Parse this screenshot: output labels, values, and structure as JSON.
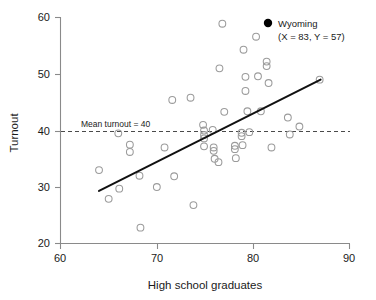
{
  "chart_data": {
    "type": "scatter",
    "title": "",
    "xlabel": "High school graduates",
    "ylabel": "Turnout",
    "xlim": [
      60,
      90
    ],
    "ylim": [
      20,
      60
    ],
    "xticks": [
      60,
      70,
      80,
      90
    ],
    "yticks": [
      20,
      30,
      40,
      50,
      60
    ],
    "xtick_labels": [
      "60",
      "70",
      "80",
      "90"
    ],
    "ytick_labels": [
      "20",
      "30",
      "40",
      "50",
      "60"
    ],
    "grid": false,
    "legend_position": "top-right",
    "marker_style": "open-circle",
    "points": [
      {
        "x": 64.0,
        "y": 33.0
      },
      {
        "x": 65.0,
        "y": 27.9
      },
      {
        "x": 66.0,
        "y": 39.5
      },
      {
        "x": 66.1,
        "y": 29.7
      },
      {
        "x": 67.2,
        "y": 37.5
      },
      {
        "x": 67.2,
        "y": 36.2
      },
      {
        "x": 68.2,
        "y": 32.0
      },
      {
        "x": 68.3,
        "y": 22.8
      },
      {
        "x": 70.0,
        "y": 30.0
      },
      {
        "x": 70.8,
        "y": 37.0
      },
      {
        "x": 71.6,
        "y": 45.4
      },
      {
        "x": 71.8,
        "y": 31.9
      },
      {
        "x": 73.5,
        "y": 45.8
      },
      {
        "x": 73.8,
        "y": 26.8
      },
      {
        "x": 74.8,
        "y": 41.0
      },
      {
        "x": 74.9,
        "y": 40.0
      },
      {
        "x": 74.9,
        "y": 39.2
      },
      {
        "x": 74.9,
        "y": 38.6
      },
      {
        "x": 74.9,
        "y": 37.2
      },
      {
        "x": 75.8,
        "y": 40.1
      },
      {
        "x": 75.9,
        "y": 37.0
      },
      {
        "x": 75.9,
        "y": 36.4
      },
      {
        "x": 76.0,
        "y": 35.0
      },
      {
        "x": 76.4,
        "y": 34.4
      },
      {
        "x": 76.5,
        "y": 51.0
      },
      {
        "x": 76.8,
        "y": 58.9
      },
      {
        "x": 77.0,
        "y": 43.3
      },
      {
        "x": 78.1,
        "y": 37.3
      },
      {
        "x": 78.1,
        "y": 36.7
      },
      {
        "x": 78.2,
        "y": 35.1
      },
      {
        "x": 78.8,
        "y": 39.6
      },
      {
        "x": 78.8,
        "y": 39.0
      },
      {
        "x": 78.9,
        "y": 37.4
      },
      {
        "x": 79.0,
        "y": 54.3
      },
      {
        "x": 79.2,
        "y": 49.5
      },
      {
        "x": 79.2,
        "y": 47.0
      },
      {
        "x": 79.4,
        "y": 43.4
      },
      {
        "x": 79.6,
        "y": 39.7
      },
      {
        "x": 80.3,
        "y": 56.6
      },
      {
        "x": 80.5,
        "y": 49.6
      },
      {
        "x": 80.8,
        "y": 43.4
      },
      {
        "x": 81.4,
        "y": 52.2
      },
      {
        "x": 81.4,
        "y": 51.4
      },
      {
        "x": 81.6,
        "y": 48.4
      },
      {
        "x": 81.9,
        "y": 37.0
      },
      {
        "x": 83.6,
        "y": 42.3
      },
      {
        "x": 83.8,
        "y": 39.3
      },
      {
        "x": 84.8,
        "y": 40.7
      },
      {
        "x": 86.9,
        "y": 49.0
      }
    ],
    "fit_line": {
      "label": "regression line",
      "x_start": 64.0,
      "y_start": 29.3,
      "x_end": 87.0,
      "y_end": 49.0
    },
    "mean_line": {
      "label": "Mean turnout = 40",
      "value": 40,
      "orientation": "horizontal",
      "style": "dashed"
    },
    "annotations": [
      {
        "name": "mean-turnout-label",
        "text": "Mean turnout = 40"
      }
    ],
    "legend": [
      {
        "marker": "filled-circle",
        "color": "#000000",
        "label": "Wyoming",
        "detail": "(X = 83, Y = 57)"
      }
    ]
  }
}
